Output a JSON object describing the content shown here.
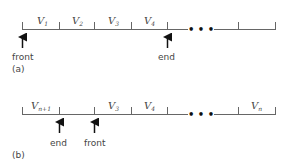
{
  "diagram_a": {
    "caption": "(a)",
    "cells": [
      {
        "base": "V",
        "sub": "1"
      },
      {
        "base": "V",
        "sub": "2"
      },
      {
        "base": "V",
        "sub": "3"
      },
      {
        "base": "V",
        "sub": "4"
      },
      {
        "base": "",
        "sub": ""
      },
      {
        "base": "",
        "sub": ""
      }
    ],
    "ellipsis": "• • •",
    "front_label": "front",
    "end_label": "end"
  },
  "diagram_b": {
    "caption": "(b)",
    "cells": [
      {
        "base": "V",
        "sub": "n+1"
      },
      {
        "base": "",
        "sub": ""
      },
      {
        "base": "V",
        "sub": "3"
      },
      {
        "base": "V",
        "sub": "4"
      },
      {
        "base": "",
        "sub": ""
      },
      {
        "base": "V",
        "sub": "n"
      }
    ],
    "ellipsis": "• • •",
    "front_label": "front",
    "end_label": "end"
  },
  "colors": {
    "line": "#555555",
    "arrow": "#111111",
    "text": "#444444"
  }
}
